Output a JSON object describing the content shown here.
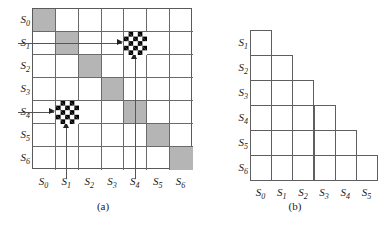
{
  "figure": {
    "state_labels": [
      "S0",
      "S1",
      "S2",
      "S3",
      "S4",
      "S5",
      "S6"
    ],
    "colors": {
      "diagonal_fill": "#b5b5b5",
      "grid_line": "#5f5f5f",
      "checker_dark": "#000000",
      "checker_light": "#ffffff",
      "arrow": "#222222",
      "background": "#ffffff"
    }
  },
  "panel_a": {
    "caption": "(a)",
    "row_labels": [
      {
        "base": "S",
        "sub": "0"
      },
      {
        "base": "S",
        "sub": "1"
      },
      {
        "base": "S",
        "sub": "2"
      },
      {
        "base": "S",
        "sub": "3"
      },
      {
        "base": "S",
        "sub": "4"
      },
      {
        "base": "S",
        "sub": "5"
      },
      {
        "base": "S",
        "sub": "6"
      }
    ],
    "col_labels": [
      {
        "base": "S",
        "sub": "0"
      },
      {
        "base": "S",
        "sub": "1"
      },
      {
        "base": "S",
        "sub": "2"
      },
      {
        "base": "S",
        "sub": "3"
      },
      {
        "base": "S",
        "sub": "4"
      },
      {
        "base": "S",
        "sub": "5"
      },
      {
        "base": "S",
        "sub": "6"
      }
    ],
    "rows": 7,
    "cols": 7,
    "diagonal_cells": [
      {
        "row": 0,
        "col": 0
      },
      {
        "row": 1,
        "col": 1
      },
      {
        "row": 2,
        "col": 2
      },
      {
        "row": 3,
        "col": 3
      },
      {
        "row": 4,
        "col": 4
      },
      {
        "row": 5,
        "col": 5
      },
      {
        "row": 6,
        "col": 6
      }
    ],
    "checkered_cells": [
      {
        "row": 1,
        "col": 4
      },
      {
        "row": 4,
        "col": 1
      }
    ],
    "arrows": [
      {
        "type": "horizontal",
        "from_row": 1,
        "to_row": 1,
        "to_col": 4
      },
      {
        "type": "vertical",
        "to_row": 1,
        "to_col": 4,
        "from_row": 6
      },
      {
        "type": "horizontal",
        "from_row": 4,
        "to_row": 4,
        "to_col": 1
      },
      {
        "type": "vertical",
        "to_row": 4,
        "to_col": 1,
        "from_row": 6
      }
    ]
  },
  "panel_b": {
    "caption": "(b)",
    "row_labels": [
      {
        "base": "S",
        "sub": "1"
      },
      {
        "base": "S",
        "sub": "2"
      },
      {
        "base": "S",
        "sub": "3"
      },
      {
        "base": "S",
        "sub": "4"
      },
      {
        "base": "S",
        "sub": "5"
      },
      {
        "base": "S",
        "sub": "6"
      }
    ],
    "col_labels": [
      {
        "base": "S",
        "sub": "0"
      },
      {
        "base": "S",
        "sub": "1"
      },
      {
        "base": "S",
        "sub": "2"
      },
      {
        "base": "S",
        "sub": "3"
      },
      {
        "base": "S",
        "sub": "4"
      },
      {
        "base": "S",
        "sub": "5"
      }
    ],
    "rows": 6,
    "cols": 6,
    "row_cell_counts": [
      1,
      2,
      3,
      4,
      5,
      6
    ]
  }
}
